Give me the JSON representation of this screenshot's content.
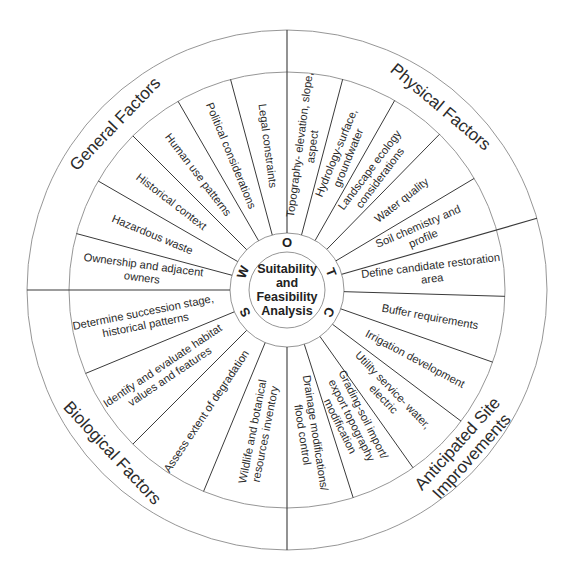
{
  "diagram": {
    "center_title_lines": [
      "Suitability",
      "and",
      "Feasibility",
      "Analysis"
    ],
    "swot_letters": [
      {
        "letter": "O",
        "angle": 90
      },
      {
        "letter": "T",
        "angle": 22
      },
      {
        "letter": "C",
        "angle": -28
      },
      {
        "letter": "S",
        "angle": 208
      },
      {
        "letter": "W",
        "angle": 158
      }
    ],
    "categories": [
      {
        "name": "General Factors",
        "label_lines": [
          "General Factors"
        ],
        "label_angle": 136,
        "start_angle": 90,
        "end_angle": 180,
        "segments": [
          {
            "label_lines": [
              "Legal constraints"
            ]
          },
          {
            "label_lines": [
              "Political considerations"
            ]
          },
          {
            "label_lines": [
              "Human use patterns"
            ]
          },
          {
            "label_lines": [
              "Historical context"
            ]
          },
          {
            "label_lines": [
              "Hazardous waste"
            ]
          },
          {
            "label_lines": [
              "Ownership and adjacent",
              "owners"
            ]
          }
        ]
      },
      {
        "name": "Biological Factors",
        "label_lines": [
          "Biological Factors"
        ],
        "label_angle": 223,
        "start_angle": 180,
        "end_angle": 270,
        "segments": [
          {
            "label_lines": [
              "Determine succession stage,",
              "historical patterns"
            ]
          },
          {
            "label_lines": [
              "Identify and evaluate habitat",
              "values and features"
            ]
          },
          {
            "label_lines": [
              "Assess extent of degradation"
            ]
          },
          {
            "label_lines": [
              "Wildlife and botanical",
              "resources inventory"
            ]
          }
        ]
      },
      {
        "name": "Anticipated Site Improvements",
        "label_lines": [
          "Anticipated Site",
          "Improvements"
        ],
        "label_angle": -42,
        "start_angle": 270,
        "end_angle": 376,
        "segments": [
          {
            "label_lines": [
              "Drainage modifications/",
              "flood control"
            ]
          },
          {
            "label_lines": [
              "Grading-soil import/",
              "export topography",
              "modification"
            ]
          },
          {
            "label_lines": [
              "Utility service- water,",
              "electric"
            ]
          },
          {
            "label_lines": [
              "Irrigation development"
            ]
          },
          {
            "label_lines": [
              "Buffer requirements"
            ]
          },
          {
            "label_lines": [
              "Define candidate restoration",
              "area"
            ]
          }
        ]
      },
      {
        "name": "Physical Factors",
        "label_lines": [
          "Physical Factors"
        ],
        "label_angle": 50,
        "start_angle": 16,
        "end_angle": 90,
        "segments": [
          {
            "label_lines": [
              "Soil chemistry and",
              "profile"
            ]
          },
          {
            "label_lines": [
              "Water quality"
            ]
          },
          {
            "label_lines": [
              "Landscape ecology",
              "considerations"
            ]
          },
          {
            "label_lines": [
              "Hydrology-surface,",
              "groundwater"
            ]
          },
          {
            "label_lines": [
              "Topography- elevation, slope,",
              "aspect"
            ]
          }
        ]
      }
    ],
    "colors": {
      "background": "#ffffff",
      "lines": "#3a3a3a",
      "rings": "#8a8a8a",
      "text": "#2b2b2b"
    }
  }
}
